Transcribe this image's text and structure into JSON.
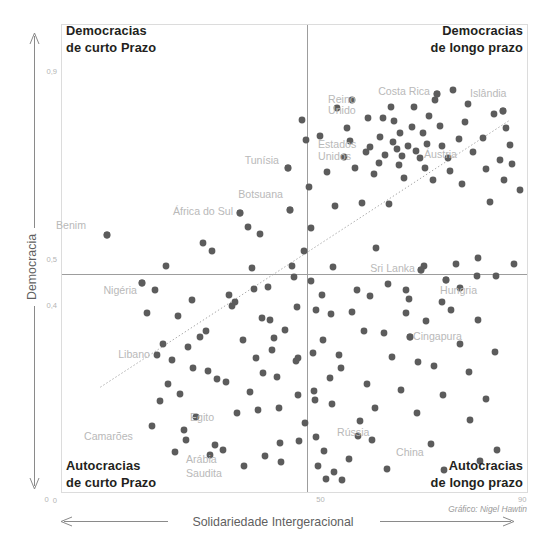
{
  "chart_data": {
    "type": "scatter",
    "title": "",
    "xlabel": "Solidariedade Intergeracional",
    "ylabel": "Democracia",
    "xlim": [
      0,
      90
    ],
    "ylim": [
      0,
      1.0
    ],
    "x_ticks": [
      {
        "value": 0,
        "label": "0"
      },
      {
        "value": 50,
        "label": "50"
      },
      {
        "value": 90,
        "label": "90"
      }
    ],
    "y_ticks": [
      {
        "value": 0,
        "label": "0"
      },
      {
        "value": 0.4,
        "label": "0,4"
      },
      {
        "value": 0.5,
        "label": "0,5"
      },
      {
        "value": 0.9,
        "label": "0,9"
      }
    ],
    "grid": false,
    "legend": "none",
    "credit": "Gráfico: Nigel Hawtin",
    "quadrant_divider_x": 50,
    "quadrant_divider_y": 0.5,
    "quadrants": [
      {
        "id": "top-left",
        "line1": "Democracias",
        "line2": "de curto Prazo"
      },
      {
        "id": "top-right",
        "line1": "Democracias",
        "line2": "de longo prazo"
      },
      {
        "id": "bottom-left",
        "line1": "Autocracias",
        "line2": "de curto Prazo"
      },
      {
        "id": "bottom-right",
        "line1": "Autocracias",
        "line2": "de longo prazo"
      }
    ],
    "trendline": {
      "x0": 7.5,
      "y0": 0.225,
      "x1": 86.5,
      "y1": 0.795,
      "style": "dotted"
    },
    "labeled_points": [
      {
        "name": "Benim",
        "px": 107,
        "py": 235,
        "lx": 86,
        "ly": 229,
        "anchor": "end"
      },
      {
        "name": "Nigéria",
        "px": 142,
        "py": 283,
        "lx": 137,
        "ly": 294,
        "anchor": "end"
      },
      {
        "name": "África do Sul",
        "px": 240,
        "py": 213,
        "lx": 233,
        "ly": 215,
        "anchor": "end"
      },
      {
        "name": "Tunísia",
        "px": 288,
        "py": 168,
        "lx": 279,
        "ly": 164,
        "anchor": "end"
      },
      {
        "name": "Botsuana",
        "px": 290,
        "py": 210,
        "lx": 283,
        "ly": 198,
        "anchor": "end"
      },
      {
        "name": "Costa Rica",
        "px": 437,
        "py": 94,
        "lx": 430,
        "ly": 95,
        "anchor": "end"
      },
      {
        "name": "Reino",
        "px": -1,
        "py": -1,
        "lx": 328,
        "ly": 103,
        "anchor": "start"
      },
      {
        "name": "Unido",
        "px": -1,
        "py": -1,
        "lx": 328,
        "ly": 114,
        "anchor": "start"
      },
      {
        "name": "Estados",
        "px": -1,
        "py": -1,
        "lx": 318,
        "ly": 148,
        "anchor": "start"
      },
      {
        "name": "Unidos",
        "px": -1,
        "py": -1,
        "lx": 318,
        "ly": 160,
        "anchor": "start"
      },
      {
        "name": "Áustria",
        "px": -1,
        "py": -1,
        "lx": 424,
        "ly": 158,
        "anchor": "start"
      },
      {
        "name": "Islândia",
        "px": 503,
        "py": 111,
        "lx": 470,
        "ly": 97,
        "anchor": "start"
      },
      {
        "name": "Sri Lanka",
        "px": 421,
        "py": 270,
        "lx": 415,
        "ly": 272,
        "anchor": "end"
      },
      {
        "name": "Hungria",
        "px": 446,
        "py": 280,
        "lx": 440,
        "ly": 294,
        "anchor": "start"
      },
      {
        "name": "Cingapura",
        "px": 410,
        "py": 337,
        "lx": 413,
        "ly": 340,
        "anchor": "start"
      },
      {
        "name": "Libano",
        "px": 157,
        "py": 355,
        "lx": 150,
        "ly": 358,
        "anchor": "end"
      },
      {
        "name": "Camarões",
        "px": -1,
        "py": -1,
        "lx": 84,
        "ly": 440,
        "anchor": "start"
      },
      {
        "name": "Egito",
        "px": -1,
        "py": -1,
        "lx": 190,
        "ly": 421,
        "anchor": "start"
      },
      {
        "name": "Arábia",
        "px": -1,
        "py": -1,
        "lx": 186,
        "ly": 463,
        "anchor": "start"
      },
      {
        "name": "Saudita",
        "px": -1,
        "py": -1,
        "lx": 186,
        "ly": 477,
        "anchor": "start"
      },
      {
        "name": "Rússia",
        "px": -1,
        "py": -1,
        "lx": 337,
        "ly": 436,
        "anchor": "start"
      },
      {
        "name": "China",
        "px": -1,
        "py": -1,
        "lx": 396,
        "ly": 456,
        "anchor": "start"
      }
    ],
    "points_px": [
      [
        107,
        235
      ],
      [
        142,
        283
      ],
      [
        166,
        266
      ],
      [
        178,
        316
      ],
      [
        180,
        394
      ],
      [
        186,
        440
      ],
      [
        193,
        368
      ],
      [
        196,
        417
      ],
      [
        203,
        243
      ],
      [
        206,
        331
      ],
      [
        208,
        371
      ],
      [
        212,
        251
      ],
      [
        215,
        445
      ],
      [
        223,
        450
      ],
      [
        229,
        295
      ],
      [
        232,
        306
      ],
      [
        237,
        413
      ],
      [
        240,
        213
      ],
      [
        248,
        227
      ],
      [
        252,
        268
      ],
      [
        254,
        289
      ],
      [
        256,
        358
      ],
      [
        260,
        234
      ],
      [
        265,
        456
      ],
      [
        268,
        287
      ],
      [
        270,
        320
      ],
      [
        274,
        338
      ],
      [
        277,
        377
      ],
      [
        279,
        408
      ],
      [
        281,
        462
      ],
      [
        288,
        168
      ],
      [
        290,
        210
      ],
      [
        292,
        266
      ],
      [
        294,
        277
      ],
      [
        297,
        307
      ],
      [
        298,
        395
      ],
      [
        299,
        441
      ],
      [
        302,
        120
      ],
      [
        304,
        251
      ],
      [
        306,
        140
      ],
      [
        309,
        187
      ],
      [
        311,
        228
      ],
      [
        311,
        281
      ],
      [
        313,
        353
      ],
      [
        315,
        400
      ],
      [
        316,
        437
      ],
      [
        318,
        466
      ],
      [
        320,
        136
      ],
      [
        322,
        295
      ],
      [
        324,
        451
      ],
      [
        326,
        479
      ],
      [
        327,
        172
      ],
      [
        330,
        378
      ],
      [
        331,
        314
      ],
      [
        333,
        267
      ],
      [
        335,
        206
      ],
      [
        337,
        108
      ],
      [
        339,
        355
      ],
      [
        342,
        480
      ],
      [
        344,
        157
      ],
      [
        347,
        128
      ],
      [
        350,
        141
      ],
      [
        352,
        100
      ],
      [
        355,
        168
      ],
      [
        357,
        290
      ],
      [
        360,
        421
      ],
      [
        362,
        203
      ],
      [
        364,
        331
      ],
      [
        366,
        152
      ],
      [
        368,
        118
      ],
      [
        370,
        147
      ],
      [
        372,
        440
      ],
      [
        374,
        174
      ],
      [
        376,
        248
      ],
      [
        379,
        163
      ],
      [
        380,
        137
      ],
      [
        383,
        118
      ],
      [
        385,
        155
      ],
      [
        387,
        469
      ],
      [
        389,
        204
      ],
      [
        391,
        107
      ],
      [
        393,
        142
      ],
      [
        394,
        121
      ],
      [
        397,
        149
      ],
      [
        399,
        165
      ],
      [
        400,
        133
      ],
      [
        402,
        156
      ],
      [
        404,
        178
      ],
      [
        406,
        313
      ],
      [
        408,
        146
      ],
      [
        410,
        337
      ],
      [
        412,
        127
      ],
      [
        414,
        107
      ],
      [
        416,
        151
      ],
      [
        418,
        362
      ],
      [
        420,
        158
      ],
      [
        421,
        270
      ],
      [
        423,
        133
      ],
      [
        425,
        168
      ],
      [
        427,
        144
      ],
      [
        429,
        116
      ],
      [
        431,
        444
      ],
      [
        433,
        180
      ],
      [
        435,
        100
      ],
      [
        437,
        94
      ],
      [
        440,
        126
      ],
      [
        442,
        146
      ],
      [
        444,
        470
      ],
      [
        446,
        280
      ],
      [
        448,
        158
      ],
      [
        450,
        171
      ],
      [
        453,
        90
      ],
      [
        456,
        264
      ],
      [
        459,
        139
      ],
      [
        462,
        184
      ],
      [
        465,
        122
      ],
      [
        468,
        104
      ],
      [
        470,
        420
      ],
      [
        473,
        152
      ],
      [
        477,
        276
      ],
      [
        480,
        461
      ],
      [
        483,
        138
      ],
      [
        486,
        169
      ],
      [
        490,
        202
      ],
      [
        494,
        114
      ],
      [
        497,
        450
      ],
      [
        500,
        160
      ],
      [
        503,
        111
      ],
      [
        506,
        128
      ],
      [
        510,
        145
      ],
      [
        152,
        426
      ],
      [
        160,
        401
      ],
      [
        168,
        384
      ],
      [
        172,
        360
      ],
      [
        188,
        347
      ],
      [
        200,
        337
      ],
      [
        217,
        379
      ],
      [
        235,
        302
      ],
      [
        243,
        340
      ],
      [
        250,
        392
      ],
      [
        258,
        410
      ],
      [
        263,
        373
      ],
      [
        272,
        350
      ],
      [
        285,
        330
      ],
      [
        296,
        361
      ],
      [
        305,
        423
      ],
      [
        314,
        391
      ],
      [
        323,
        340
      ],
      [
        332,
        404
      ],
      [
        341,
        368
      ],
      [
        349,
        459
      ],
      [
        358,
        436
      ],
      [
        367,
        384
      ],
      [
        375,
        408
      ],
      [
        384,
        333
      ],
      [
        392,
        357
      ],
      [
        401,
        390
      ],
      [
        409,
        299
      ],
      [
        417,
        413
      ],
      [
        426,
        321
      ],
      [
        434,
        366
      ],
      [
        443,
        395
      ],
      [
        451,
        310
      ],
      [
        460,
        344
      ],
      [
        469,
        372
      ],
      [
        478,
        320
      ],
      [
        486,
        399
      ],
      [
        495,
        352
      ],
      [
        504,
        180
      ],
      [
        512,
        164
      ],
      [
        520,
        190
      ],
      [
        147,
        313
      ],
      [
        155,
        290
      ],
      [
        163,
        344
      ],
      [
        175,
        452
      ],
      [
        184,
        430
      ],
      [
        192,
        300
      ],
      [
        210,
        455
      ],
      [
        226,
        382
      ],
      [
        244,
        466
      ],
      [
        262,
        318
      ],
      [
        280,
        443
      ],
      [
        298,
        358
      ],
      [
        316,
        310
      ],
      [
        334,
        472
      ],
      [
        352,
        312
      ],
      [
        370,
        296
      ],
      [
        388,
        284
      ],
      [
        406,
        290
      ],
      [
        424,
        266
      ],
      [
        442,
        302
      ],
      [
        460,
        288
      ],
      [
        478,
        258
      ],
      [
        496,
        276
      ],
      [
        514,
        264
      ]
    ],
    "point_radius": 3.4,
    "point_color": "#5c5c5c"
  },
  "axes": {
    "y_arrow_label": "Democracia",
    "x_arrow_label": "Solidariedade Intergeracional"
  }
}
